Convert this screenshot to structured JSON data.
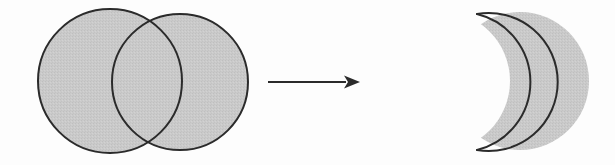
{
  "figure": {
    "title": "Boolean subtraction of two overlapping circles yielding a crescent",
    "operation_label": "subtract",
    "background_color": "#fdfdfd",
    "shape_fill_color": "#c8c8c8",
    "shape_outline_color": "#2b2b2b",
    "outline_width": 2,
    "fill_texture": "dithered-halftone-gray"
  },
  "chart_data": {
    "type": "diagram",
    "title": "",
    "shapes": [
      {
        "name": "circle-a",
        "role": "operand-left",
        "kind": "circle",
        "cx": 110,
        "cy": 81,
        "r": 72,
        "fill": "#c8c8c8",
        "stroke": "#2b2b2b"
      },
      {
        "name": "circle-b",
        "role": "operand-right",
        "kind": "circle",
        "cx": 180,
        "cy": 82,
        "r": 68,
        "fill": "#c8c8c8",
        "stroke": "#2b2b2b"
      },
      {
        "name": "crescent",
        "role": "result",
        "kind": "crescent",
        "outer_cx": 520,
        "outer_cy": 81,
        "outer_r": 69,
        "cut_cx": 440,
        "cut_cy": 81,
        "cut_r": 70,
        "tip_top": [
          477,
          14
        ],
        "tip_bottom": [
          477,
          150
        ],
        "concave_apex": [
          509,
          81
        ],
        "fill": "#c8c8c8",
        "stroke": "#2b2b2b"
      }
    ],
    "arrow": {
      "name": "transform-arrow",
      "from": [
        268,
        82
      ],
      "to": [
        360,
        82
      ],
      "direction": "right",
      "head_length": 16,
      "head_width": 13,
      "color": "#2b2b2b"
    },
    "annotations": [],
    "legend": null,
    "grid": false
  }
}
